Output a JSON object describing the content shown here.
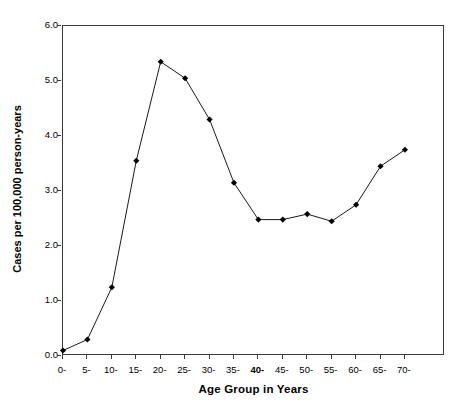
{
  "chart_data": {
    "type": "line",
    "title": "",
    "xlabel": "Age Group in Years",
    "ylabel": "Cases per 100,000 person-years",
    "categories": [
      "0-",
      "5-",
      "10-",
      "15-",
      "20-",
      "25-",
      "30-",
      "35-",
      "40-",
      "45-",
      "50-",
      "55-",
      "60-",
      "65-",
      "70-"
    ],
    "values": [
      0.1,
      0.3,
      1.25,
      3.55,
      5.35,
      5.05,
      4.3,
      3.15,
      2.48,
      2.48,
      2.58,
      2.45,
      2.75,
      3.45,
      3.75
    ],
    "x_tick_labels": [
      "0-",
      "5-",
      "10-",
      "15-",
      "20-",
      "25-",
      "30-",
      "35-",
      "40-",
      "45-",
      "50-",
      "55-",
      "60-",
      "65-",
      "70-"
    ],
    "x_tick_bold": [
      false,
      false,
      false,
      false,
      false,
      false,
      false,
      false,
      true,
      false,
      false,
      false,
      false,
      false,
      false
    ],
    "y_tick_labels": [
      "0.0",
      "1.0",
      "2.0",
      "3.0",
      "4.0",
      "5.0",
      "6.0"
    ],
    "y_tick_values": [
      0.0,
      1.0,
      2.0,
      3.0,
      4.0,
      5.0,
      6.0
    ],
    "ylim": [
      0.0,
      6.0
    ],
    "grid": false,
    "legend": null,
    "marker": "diamond",
    "line_color": "#1a1a1a",
    "marker_color": "#000000",
    "frame_color": "#3a3a3a"
  }
}
